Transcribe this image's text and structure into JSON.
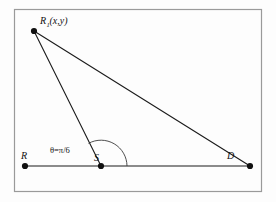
{
  "figure": {
    "background_color": "#fdfdfd",
    "border_color": "#9a9a9a",
    "line_color": "#1b1b1b",
    "arc_color": "#3a3a3a",
    "point_color": "#101010"
  },
  "labels": {
    "apex_main": "R",
    "apex_subscript": "1",
    "apex_coords": "(x,y)",
    "left_point": "R",
    "mid_point": "S",
    "right_point": "D",
    "angle": "θ=π/6"
  },
  "geometry": {
    "frame": {
      "x": 14,
      "y": 9,
      "width": 248,
      "height": 183
    },
    "points": [
      {
        "name": "R1",
        "label": "R₁(x,y)",
        "x": 34,
        "y": 31
      },
      {
        "name": "R",
        "label": "R",
        "x": 25,
        "y": 166
      },
      {
        "name": "S",
        "label": "S",
        "x": 101,
        "y": 166
      },
      {
        "name": "D",
        "label": "D",
        "x": 250,
        "y": 166
      }
    ],
    "segments": [
      {
        "name": "R1-to-S",
        "from": "R1",
        "to": "S"
      },
      {
        "name": "R1-to-D",
        "from": "R1",
        "to": "D"
      },
      {
        "name": "R-to-D-baseline",
        "from": "R",
        "to": "D"
      }
    ],
    "angle_arc": {
      "vertex": "S",
      "radius": 26,
      "start_deg": 0,
      "end_deg": 150,
      "value": "θ=π/6"
    }
  }
}
